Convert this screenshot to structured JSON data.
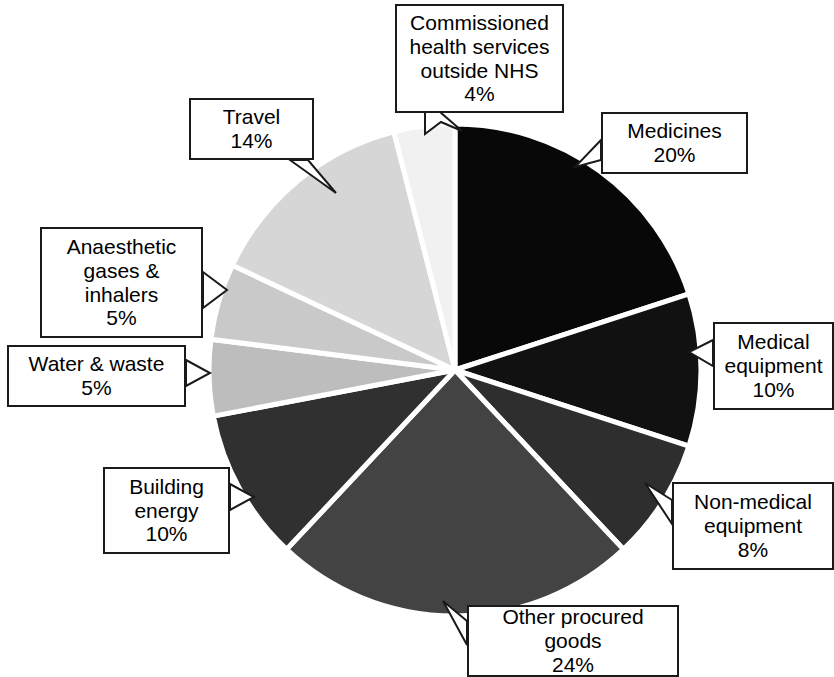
{
  "chart_data": {
    "type": "pie",
    "title": "",
    "subtitle": "",
    "xlabel": "",
    "ylabel": "",
    "legend_position": "callout-labels",
    "grid": false,
    "units": "%",
    "start_angle_deg": 0,
    "direction": "clockwise",
    "categories": [
      "Medicines",
      "Medical equipment",
      "Non-medical equipment",
      "Other procured goods",
      "Building energy",
      "Water & waste",
      "Anaesthetic gases & inhalers",
      "Travel",
      "Commissioned health services outside NHS"
    ],
    "values": [
      20,
      10,
      8,
      24,
      10,
      5,
      5,
      14,
      4
    ],
    "colors": [
      "#080808",
      "#111111",
      "#2e2e2e",
      "#434343",
      "#303030",
      "#bdbdbd",
      "#c9c9c9",
      "#d6d6d6",
      "#f1f1f1"
    ],
    "slice_border_color": "#ffffff"
  },
  "callouts": [
    {
      "id": "commissioned",
      "label": "Commissioned\nhealth services\noutside NHS",
      "percent": "4%"
    },
    {
      "id": "medicines",
      "label": "Medicines",
      "percent": "20%"
    },
    {
      "id": "medequip",
      "label": "Medical\nequipment",
      "percent": "10%"
    },
    {
      "id": "nonmed",
      "label": "Non-medical\nequipment",
      "percent": "8%"
    },
    {
      "id": "other",
      "label": "Other procured\ngoods",
      "percent": "24%"
    },
    {
      "id": "building",
      "label": "Building\nenergy",
      "percent": "10%"
    },
    {
      "id": "water",
      "label": "Water & waste",
      "percent": "5%"
    },
    {
      "id": "anaesth",
      "label": "Anaesthetic\ngases &\ninhalers",
      "percent": "5%"
    },
    {
      "id": "travel",
      "label": "Travel",
      "percent": "14%"
    }
  ]
}
